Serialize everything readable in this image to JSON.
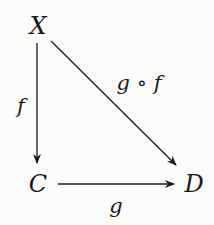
{
  "diagram": {
    "type": "commutative-diagram",
    "nodes": [
      {
        "id": "X",
        "label": "X"
      },
      {
        "id": "C",
        "label": "C"
      },
      {
        "id": "D",
        "label": "D"
      }
    ],
    "edges": [
      {
        "from": "X",
        "to": "C",
        "label": "f"
      },
      {
        "from": "X",
        "to": "D",
        "label": "g ∘ f"
      },
      {
        "from": "C",
        "to": "D",
        "label": "g"
      }
    ],
    "colors": {
      "ink": "#1a1a1a",
      "background": "#fbfbf9"
    }
  }
}
